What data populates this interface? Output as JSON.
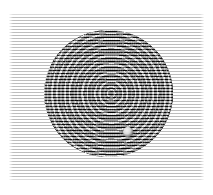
{
  "figure": {
    "caption": "",
    "background_color": "#ffffff",
    "plate": {
      "name": "scanned-plate",
      "x": 9,
      "y": 13,
      "width": 195,
      "height": 168,
      "background_color": "#ffffff"
    },
    "raster": {
      "name": "horizontal-scanlines",
      "orientation": "horizontal",
      "period_px": 3,
      "line_color": "#b4b4b4",
      "gap_color": "#ffffff"
    },
    "disc": {
      "name": "interference-disc",
      "shape": "circle",
      "center_x": 108,
      "center_y": 93,
      "radius_x": 64,
      "radius_y": 63,
      "fringe_dark_color": "#0b0b0b",
      "fringe_light_color": "#d8d8d8",
      "fringe_period_px": 4,
      "pattern": "concentric-rings",
      "lobes": "vertical-elliptical-beats"
    },
    "artifact": {
      "name": "bright-blob",
      "x": 127,
      "y": 131,
      "diameter": 10,
      "highlight_color": "#f2f2f2",
      "shadow_color": "#242424"
    }
  }
}
